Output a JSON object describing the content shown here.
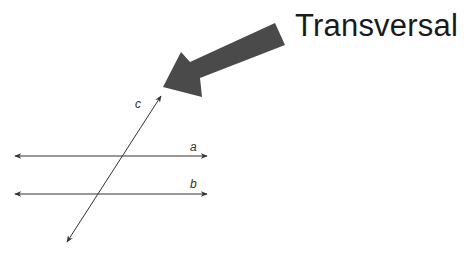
{
  "diagram": {
    "title": "Transversal",
    "pointer_arrow": {
      "color": "#4a4a4a",
      "direction": "down-left",
      "points_to": "line c"
    },
    "lines": [
      {
        "id": "a",
        "label": "a",
        "type": "parallel",
        "orientation": "horizontal",
        "x1": 15,
        "y1": 156,
        "x2": 207,
        "y2": 156
      },
      {
        "id": "b",
        "label": "b",
        "type": "parallel",
        "orientation": "horizontal",
        "x1": 15,
        "y1": 194,
        "x2": 207,
        "y2": 194
      },
      {
        "id": "c",
        "label": "c",
        "type": "transversal",
        "orientation": "diagonal",
        "x1": 67,
        "y1": 242,
        "x2": 161,
        "y2": 96
      }
    ],
    "line_color": "#333333"
  }
}
